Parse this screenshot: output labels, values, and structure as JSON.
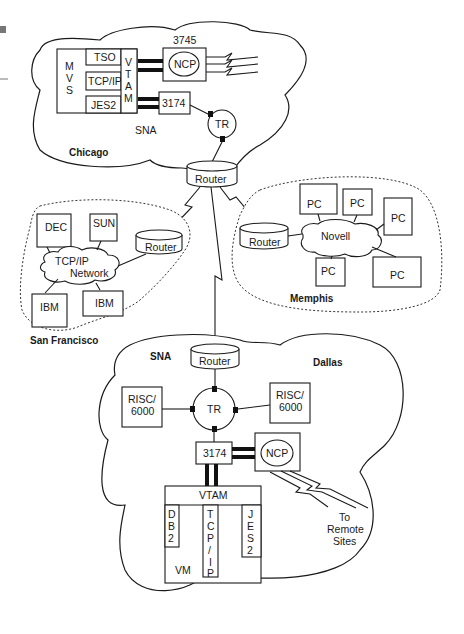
{
  "page_marker": {
    "color": "#777777"
  },
  "chicago": {
    "site_label": "Chicago",
    "network_label": "SNA",
    "host": {
      "os_label_letters": [
        "M",
        "V",
        "S"
      ],
      "subsystems": [
        "TSO",
        "TCP/IP",
        "JES2"
      ],
      "vtam_letters": [
        "V",
        "T",
        "A",
        "M"
      ]
    },
    "fep": {
      "model": "3745",
      "label": "NCP"
    },
    "controller": "3174",
    "token_ring": "TR",
    "router": "Router"
  },
  "san_francisco": {
    "site_label": "San Francisco",
    "network_label_line1": "TCP/IP",
    "network_label_line2": "Network",
    "nodes": [
      "DEC",
      "SUN",
      "IBM",
      "IBM"
    ],
    "router": "Router"
  },
  "memphis": {
    "site_label": "Memphis",
    "network_label": "Novell",
    "nodes": [
      "PC",
      "PC",
      "PC",
      "PC",
      "PC"
    ],
    "router": "Router"
  },
  "dallas": {
    "site_label": "Dallas",
    "network_label": "SNA",
    "router": "Router",
    "token_ring": "TR",
    "risc_left_line1": "RISC/",
    "risc_left_line2": "6000",
    "risc_right_line1": "RISC/",
    "risc_right_line2": "6000",
    "controller": "3174",
    "fep_label": "NCP",
    "host": {
      "vtam_label": "VTAM",
      "db2_letters": [
        "D",
        "B",
        "2"
      ],
      "tcpip_letters": [
        "T",
        "C",
        "P",
        "/",
        "I",
        "P"
      ],
      "jes2_letters": [
        "J",
        "E",
        "S",
        "2"
      ],
      "os_label": "VM"
    },
    "remote_line1": "To",
    "remote_line2": "Remote",
    "remote_line3": "Sites"
  }
}
